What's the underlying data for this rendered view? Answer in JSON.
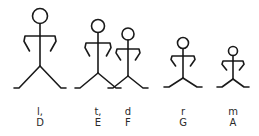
{
  "diagram": {
    "stroke_color": "#1a1a1a",
    "label_color": "#2a2a2a",
    "figures": [
      {
        "syllable": "l,",
        "note": "D",
        "cx": 40,
        "head_cy": 16,
        "head_r": 7.5,
        "shoulder_y": 36,
        "arm_span": 15,
        "hand_y": 51,
        "hand_in": 10,
        "hip_y": 66,
        "foot_y": 88,
        "foot_spread": 24
      },
      {
        "syllable": "t,",
        "note": "E",
        "cx": 98,
        "head_cy": 26,
        "head_r": 6.5,
        "shoulder_y": 43,
        "arm_span": 12,
        "hand_y": 56,
        "hand_in": 8,
        "hip_y": 73,
        "foot_y": 88,
        "foot_spread": 21
      },
      {
        "syllable": "d",
        "note": "F",
        "cx": 128,
        "head_cy": 34,
        "head_r": 6,
        "shoulder_y": 49,
        "arm_span": 11,
        "hand_y": 60,
        "hand_in": 7,
        "hip_y": 76,
        "foot_y": 88,
        "foot_spread": 18
      },
      {
        "syllable": "r",
        "note": "G",
        "cx": 183,
        "head_cy": 43,
        "head_r": 5.5,
        "shoulder_y": 56,
        "arm_span": 11,
        "hand_y": 66,
        "hand_in": 7,
        "hip_y": 78,
        "foot_y": 87,
        "foot_spread": 17
      },
      {
        "syllable": "m",
        "note": "A",
        "cx": 233,
        "head_cy": 51,
        "head_r": 4.5,
        "shoulder_y": 61,
        "arm_span": 10,
        "hand_y": 70,
        "hand_in": 6,
        "hip_y": 79,
        "foot_y": 87,
        "foot_spread": 14
      }
    ]
  }
}
